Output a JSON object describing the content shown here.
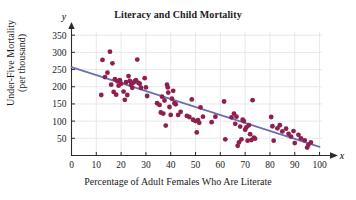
{
  "chart_data": {
    "type": "scatter",
    "title": "Literacy and Child Mortality",
    "xlabel": "Percentage of Adult Females Who Are Literate",
    "ylabel_line1": "Under-Five Mortality",
    "ylabel_line2": "(per thousand)",
    "x_axis_symbol": "x",
    "y_axis_symbol": "y",
    "xlim": [
      0,
      103
    ],
    "ylim": [
      0,
      365
    ],
    "xticks": [
      0,
      10,
      20,
      30,
      40,
      50,
      60,
      70,
      80,
      90,
      100
    ],
    "yticks": [
      50,
      100,
      150,
      200,
      250,
      300,
      350
    ],
    "grid": true,
    "legend": "none",
    "point_color": "#8e1f4e",
    "line_color": "#6d6fae",
    "grid_color": "#e2e2e8",
    "axis_color": "#2b2b33",
    "trendline": {
      "label": "least-squares regression line",
      "x": [
        0,
        100
      ],
      "y": [
        257,
        25
      ]
    },
    "points": [
      [
        12.5,
        278
      ],
      [
        12.0,
        176
      ],
      [
        13.5,
        228
      ],
      [
        14.5,
        241
      ],
      [
        15.5,
        302
      ],
      [
        16.0,
        206
      ],
      [
        16.5,
        268
      ],
      [
        17.0,
        185
      ],
      [
        17.5,
        222
      ],
      [
        18.0,
        177
      ],
      [
        18.5,
        216
      ],
      [
        19.0,
        203
      ],
      [
        19.5,
        219
      ],
      [
        20.0,
        209
      ],
      [
        21.0,
        186
      ],
      [
        21.5,
        162
      ],
      [
        22.0,
        213
      ],
      [
        22.5,
        176
      ],
      [
        23.0,
        231
      ],
      [
        23.5,
        217
      ],
      [
        24.0,
        205
      ],
      [
        24.5,
        197
      ],
      [
        25.0,
        212
      ],
      [
        25.5,
        216
      ],
      [
        26.0,
        219
      ],
      [
        26.5,
        279
      ],
      [
        27.0,
        211
      ],
      [
        27.5,
        209
      ],
      [
        28.0,
        197
      ],
      [
        29.5,
        225
      ],
      [
        30.0,
        198
      ],
      [
        30.5,
        173
      ],
      [
        34.5,
        152
      ],
      [
        35.5,
        147
      ],
      [
        36.0,
        125
      ],
      [
        36.5,
        171
      ],
      [
        37.0,
        122
      ],
      [
        37.5,
        160
      ],
      [
        38.0,
        87
      ],
      [
        38.5,
        206
      ],
      [
        38.8,
        198
      ],
      [
        39.0,
        183
      ],
      [
        39.5,
        141
      ],
      [
        40.0,
        118
      ],
      [
        40.5,
        165
      ],
      [
        41.0,
        188
      ],
      [
        41.5,
        152
      ],
      [
        42.0,
        149
      ],
      [
        43.0,
        118
      ],
      [
        44.0,
        127
      ],
      [
        46.5,
        115
      ],
      [
        47.5,
        112
      ],
      [
        48.5,
        163
      ],
      [
        49.0,
        104
      ],
      [
        50.0,
        100
      ],
      [
        50.5,
        67
      ],
      [
        51.0,
        103
      ],
      [
        51.5,
        95
      ],
      [
        52.0,
        140
      ],
      [
        53.0,
        113
      ],
      [
        56.5,
        97
      ],
      [
        58.0,
        113
      ],
      [
        61.5,
        157
      ],
      [
        62.0,
        47
      ],
      [
        64.5,
        111
      ],
      [
        65.5,
        122
      ],
      [
        66.0,
        92
      ],
      [
        66.5,
        113
      ],
      [
        67.0,
        28
      ],
      [
        67.5,
        38
      ],
      [
        68.0,
        84
      ],
      [
        68.5,
        47
      ],
      [
        69.0,
        104
      ],
      [
        69.5,
        100
      ],
      [
        70.0,
        75
      ],
      [
        70.5,
        82
      ],
      [
        71.0,
        43
      ],
      [
        71.5,
        88
      ],
      [
        72.0,
        62
      ],
      [
        72.5,
        45
      ],
      [
        73.0,
        161
      ],
      [
        73.5,
        52
      ],
      [
        74.0,
        49
      ],
      [
        80.5,
        112
      ],
      [
        81.0,
        85
      ],
      [
        81.5,
        43
      ],
      [
        83.0,
        79
      ],
      [
        84.0,
        88
      ],
      [
        85.0,
        70
      ],
      [
        86.5,
        78
      ],
      [
        87.5,
        63
      ],
      [
        88.5,
        55
      ],
      [
        89.5,
        71
      ],
      [
        90.0,
        36
      ],
      [
        91.5,
        60
      ],
      [
        92.5,
        50
      ],
      [
        94.0,
        44
      ],
      [
        95.0,
        23
      ],
      [
        95.5,
        31
      ],
      [
        96.5,
        38
      ]
    ]
  }
}
